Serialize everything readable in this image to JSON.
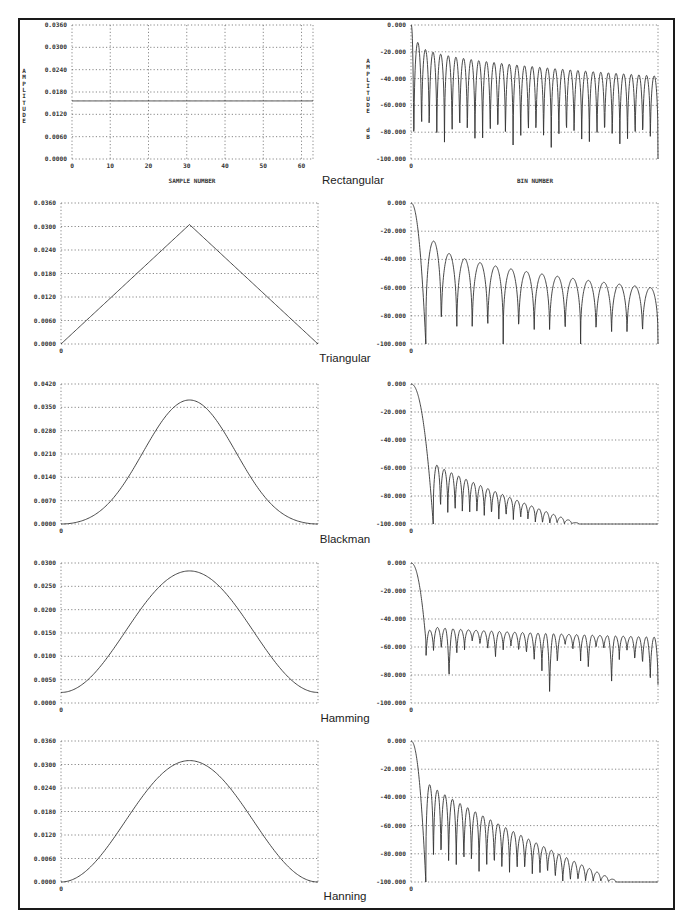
{
  "figure": {
    "window_labels": [
      "Rectangular",
      "Triangular",
      "Blackman",
      "Hamming",
      "Hanning"
    ],
    "time_xlabel": "SAMPLE NUMBER",
    "time_ylabel": "AMPLITUDE",
    "freq_xlabel": "BIN NUMBER",
    "freq_ylabel": "AMPLITUDE dB",
    "line_color": "#333333",
    "grid_color": "#555555",
    "border_color": "#1a1a1a"
  },
  "chart_data": [
    {
      "type": "line",
      "title": "Rectangular (time domain)",
      "xlabel": "SAMPLE NUMBER",
      "ylabel": "AMPLITUDE",
      "x_ticks": [
        "0",
        "10",
        "20",
        "30",
        "40",
        "50",
        "60"
      ],
      "y_ticks": [
        "0.0360",
        "0.0300",
        "0.0240",
        "0.0180",
        "0.0120",
        "0.0060",
        "0.0000"
      ],
      "xlim": [
        0,
        63
      ],
      "ylim": [
        0,
        0.036
      ],
      "grid": true,
      "series": [
        {
          "name": "Rectangular",
          "window": "rectangular",
          "N": 64,
          "amplitude": 0.0156
        }
      ]
    },
    {
      "type": "line",
      "title": "Rectangular (frequency response)",
      "xlabel": "BIN NUMBER",
      "ylabel": "AMPLITUDE dB",
      "x_ticks": [
        "0"
      ],
      "y_ticks": [
        "0.000",
        "-20.000",
        "-40.000",
        "-60.000",
        "-80.000",
        "-100.000"
      ],
      "ylim": [
        -100,
        0
      ],
      "grid": true,
      "series": [
        {
          "name": "Rectangular",
          "first_sidelobe_db": -13,
          "far_sidelobe_db": -38,
          "lobes": 32
        }
      ]
    },
    {
      "type": "line",
      "title": "Triangular (time domain)",
      "x_ticks": [
        "0"
      ],
      "y_ticks": [
        "0.0360",
        "0.0300",
        "0.0240",
        "0.0180",
        "0.0120",
        "0.0060",
        "0.0000"
      ],
      "ylim": [
        0,
        0.036
      ],
      "grid": true,
      "series": [
        {
          "name": "Triangular",
          "window": "triangular",
          "N": 64,
          "peak": 0.0305
        }
      ]
    },
    {
      "type": "line",
      "title": "Triangular (frequency response)",
      "x_ticks": [
        "0"
      ],
      "y_ticks": [
        "0.000",
        "-20.000",
        "-40.000",
        "-60.000",
        "-80.000",
        "-100.000"
      ],
      "ylim": [
        -100,
        0
      ],
      "grid": true,
      "series": [
        {
          "name": "Triangular",
          "first_sidelobe_db": -27,
          "far_sidelobe_db": -60,
          "lobes": 15
        }
      ]
    },
    {
      "type": "line",
      "title": "Blackman (time domain)",
      "x_ticks": [
        "0"
      ],
      "y_ticks": [
        "0.0420",
        "0.0350",
        "0.0280",
        "0.0210",
        "0.0140",
        "0.0070",
        "0.0000"
      ],
      "ylim": [
        0,
        0.042
      ],
      "grid": true,
      "series": [
        {
          "name": "Blackman",
          "window": "blackman",
          "N": 64,
          "peak": 0.0372
        }
      ]
    },
    {
      "type": "line",
      "title": "Blackman (frequency response)",
      "x_ticks": [
        "0"
      ],
      "y_ticks": [
        "0.000",
        "-20.000",
        "-40.000",
        "-60.000",
        "-80.000",
        "-100.000"
      ],
      "ylim": [
        -100,
        0
      ],
      "grid": true,
      "series": [
        {
          "name": "Blackman",
          "first_sidelobe_db": -58,
          "floor_db": -100,
          "lobes": 20
        }
      ]
    },
    {
      "type": "line",
      "title": "Hamming (time domain)",
      "x_ticks": [
        "0"
      ],
      "y_ticks": [
        "0.0300",
        "0.0250",
        "0.0200",
        "0.0150",
        "0.0100",
        "0.0050",
        "0.0000"
      ],
      "ylim": [
        0,
        0.03
      ],
      "grid": true,
      "series": [
        {
          "name": "Hamming",
          "window": "hamming",
          "N": 64,
          "peak": 0.0283,
          "edge": 0.0022
        }
      ]
    },
    {
      "type": "line",
      "title": "Hamming (frequency response)",
      "x_ticks": [
        "0"
      ],
      "y_ticks": [
        "0.000",
        "-20.000",
        "-40.000",
        "-60.000",
        "-80.000",
        "-100.000"
      ],
      "ylim": [
        -100,
        0
      ],
      "grid": true,
      "series": [
        {
          "name": "Hamming",
          "first_sidelobe_db": -45,
          "far_sidelobe_db": -53,
          "lobes": 30
        }
      ]
    },
    {
      "type": "line",
      "title": "Hanning (time domain)",
      "x_ticks": [
        "0"
      ],
      "y_ticks": [
        "0.0360",
        "0.0300",
        "0.0240",
        "0.0180",
        "0.0120",
        "0.0060",
        "0.0000"
      ],
      "ylim": [
        0,
        0.036
      ],
      "grid": true,
      "series": [
        {
          "name": "Hanning",
          "window": "hanning",
          "N": 64,
          "peak": 0.031
        }
      ]
    },
    {
      "type": "line",
      "title": "Hanning (frequency response)",
      "x_ticks": [
        "0"
      ],
      "y_ticks": [
        "0.000",
        "-20.000",
        "-40.000",
        "-60.000",
        "-80.000",
        "-100.000"
      ],
      "ylim": [
        -100,
        0
      ],
      "grid": true,
      "series": [
        {
          "name": "Hanning",
          "first_sidelobe_db": -31,
          "floor_db": -100,
          "lobes": 25
        }
      ]
    }
  ]
}
